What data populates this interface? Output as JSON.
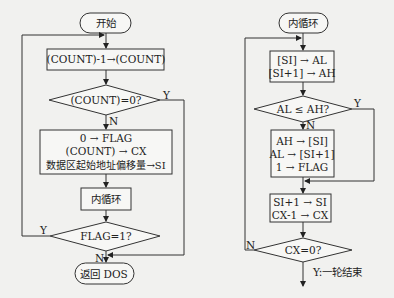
{
  "left_flowchart": {
    "start": "开始",
    "step1": "(COUNT)-1→(COUNT)",
    "decision1": "(COUNT)=0?",
    "decision1_yes": "Y",
    "decision1_no": "N",
    "step2_lines": [
      "0 → FLAG",
      "(COUNT) → CX",
      "数据区起始地址偏移量→SI"
    ],
    "inner_loop": "内循环",
    "decision2": "FLAG=1?",
    "decision2_yes": "Y",
    "decision2_no": "N",
    "end": "返回 DOS"
  },
  "right_flowchart": {
    "start": "内循环",
    "step1_lines": [
      "[SI] → AL",
      "[SI+1] → AH"
    ],
    "decision1": "AL ≤ AH?",
    "decision1_yes": "Y",
    "decision1_no": "N",
    "step2_lines": [
      "AH → [SI]",
      "AL → [SI+1]",
      "1 → FLAG"
    ],
    "step3_lines": [
      "SI+1 → SI",
      "CX-1 → CX"
    ],
    "decision2": "CX=0?",
    "decision2_no": "N",
    "decision2_yes": "Y:一轮结束"
  }
}
